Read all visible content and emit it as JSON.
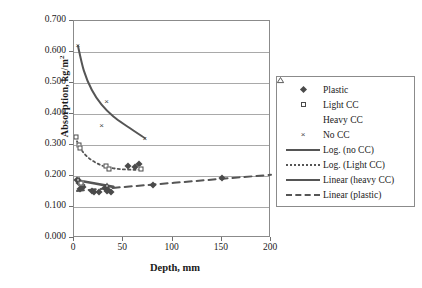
{
  "chart_data": {
    "type": "scatter",
    "title": "",
    "xlabel": "Depth, mm",
    "ylabel": "Absorption, kg/m",
    "ylabel_sup": "2",
    "xlim": [
      0,
      200
    ],
    "ylim": [
      0.0,
      0.7
    ],
    "xticks": [
      "0",
      "50",
      "100",
      "150",
      "200"
    ],
    "xtick_values": [
      0,
      50,
      100,
      150,
      200
    ],
    "yticks": [
      "0.000",
      "0.100",
      "0.200",
      "0.300",
      "0.400",
      "0.500",
      "0.600",
      "0.700"
    ],
    "ytick_values": [
      0.0,
      0.1,
      0.2,
      0.3,
      0.4,
      0.5,
      0.6,
      0.7
    ],
    "grid": "horizontal",
    "legend_position": "right-outside",
    "series": [
      {
        "name": "Plastic",
        "marker": "filled-diamond",
        "color": "#4a4a4a",
        "points": [
          {
            "x": 3,
            "y": 0.186
          },
          {
            "x": 5,
            "y": 0.178
          },
          {
            "x": 6,
            "y": 0.158
          },
          {
            "x": 8,
            "y": 0.172
          },
          {
            "x": 9,
            "y": 0.166
          },
          {
            "x": 18,
            "y": 0.152
          },
          {
            "x": 20,
            "y": 0.148
          },
          {
            "x": 25,
            "y": 0.15
          },
          {
            "x": 31,
            "y": 0.16
          },
          {
            "x": 33,
            "y": 0.152
          },
          {
            "x": 35,
            "y": 0.155
          },
          {
            "x": 38,
            "y": 0.15
          },
          {
            "x": 55,
            "y": 0.232
          },
          {
            "x": 62,
            "y": 0.228
          },
          {
            "x": 66,
            "y": 0.24
          },
          {
            "x": 80,
            "y": 0.17
          },
          {
            "x": 150,
            "y": 0.192
          }
        ]
      },
      {
        "name": "Light CC",
        "marker": "open-square",
        "color": "#4a4a4a",
        "points": [
          {
            "x": 2,
            "y": 0.325
          },
          {
            "x": 5,
            "y": 0.3
          },
          {
            "x": 6,
            "y": 0.29
          },
          {
            "x": 32,
            "y": 0.232
          },
          {
            "x": 36,
            "y": 0.222
          },
          {
            "x": 68,
            "y": 0.222
          },
          {
            "x": 7,
            "y": 0.178
          }
        ]
      },
      {
        "name": "Heavy CC",
        "marker": "open-triangle",
        "color": "#4a4a4a",
        "points": [
          {
            "x": 5,
            "y": 0.19
          },
          {
            "x": 34,
            "y": 0.17
          }
        ]
      },
      {
        "name": "No CC",
        "marker": "cross-x",
        "color": "#4a4a4a",
        "points": [
          {
            "x": 4,
            "y": 0.618
          },
          {
            "x": 33,
            "y": 0.44
          },
          {
            "x": 28,
            "y": 0.36
          },
          {
            "x": 72,
            "y": 0.318
          }
        ]
      }
    ],
    "trendlines": [
      {
        "name": "Log. (no CC)",
        "style": "solid",
        "width": 2.0,
        "color": "#555555",
        "path": [
          {
            "x": 4,
            "y": 0.62
          },
          {
            "x": 10,
            "y": 0.54
          },
          {
            "x": 18,
            "y": 0.478
          },
          {
            "x": 28,
            "y": 0.43
          },
          {
            "x": 40,
            "y": 0.392
          },
          {
            "x": 55,
            "y": 0.358
          },
          {
            "x": 72,
            "y": 0.322
          }
        ]
      },
      {
        "name": "Log. (Light CC)",
        "style": "dotted",
        "width": 1.8,
        "color": "#555555",
        "path": [
          {
            "x": 3,
            "y": 0.312
          },
          {
            "x": 8,
            "y": 0.282
          },
          {
            "x": 15,
            "y": 0.258
          },
          {
            "x": 24,
            "y": 0.24
          },
          {
            "x": 34,
            "y": 0.228
          },
          {
            "x": 48,
            "y": 0.222
          },
          {
            "x": 62,
            "y": 0.22
          },
          {
            "x": 68,
            "y": 0.221
          }
        ]
      },
      {
        "name": "Linear (heavy CC)",
        "style": "solid",
        "width": 2.6,
        "color": "#555555",
        "path": [
          {
            "x": 3,
            "y": 0.186
          },
          {
            "x": 40,
            "y": 0.165
          }
        ]
      },
      {
        "name": "Linear (plastic)",
        "style": "dashed",
        "width": 2.0,
        "color": "#555555",
        "path": [
          {
            "x": 3,
            "y": 0.152
          },
          {
            "x": 200,
            "y": 0.204
          }
        ]
      }
    ],
    "legend": [
      {
        "label": "Plastic",
        "symbol": "filled-diamond"
      },
      {
        "label": "Light CC",
        "symbol": "open-square"
      },
      {
        "label": "Heavy CC",
        "symbol": "open-triangle"
      },
      {
        "label": "No CC",
        "symbol": "cross-x"
      },
      {
        "label": "Log. (no CC)",
        "symbol": "line-solid-thin"
      },
      {
        "label": "Log. (Light CC)",
        "symbol": "line-dotted"
      },
      {
        "label": "Linear (heavy CC)",
        "symbol": "line-solid-thick"
      },
      {
        "label": "Linear (plastic)",
        "symbol": "line-dashed"
      }
    ]
  }
}
